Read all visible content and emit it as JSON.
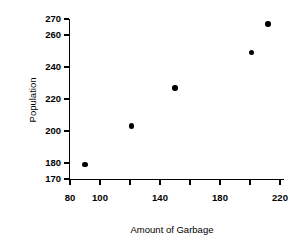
{
  "chart_data": {
    "type": "scatter",
    "title": "",
    "xlabel": "Amount of Garbage",
    "ylabel": "Population",
    "xlim": [
      80,
      222
    ],
    "ylim": [
      170,
      270
    ],
    "grid": false,
    "legend": null,
    "marker": {
      "shape": "circle",
      "color": "#000000",
      "size": 5.6
    },
    "x_ticks": [
      80,
      100,
      120,
      140,
      160,
      180,
      200,
      220
    ],
    "x_tick_labels": [
      "80",
      "100",
      "",
      "140",
      "",
      "180",
      "",
      "220"
    ],
    "y_ticks": [
      170,
      180,
      200,
      220,
      240,
      260,
      270
    ],
    "y_tick_labels": [
      "170",
      "180",
      "200",
      "220",
      "240",
      "260",
      "270"
    ],
    "points": [
      {
        "x": 90,
        "y": 179
      },
      {
        "x": 121,
        "y": 203
      },
      {
        "x": 150,
        "y": 227
      },
      {
        "x": 201,
        "y": 249
      },
      {
        "x": 212,
        "y": 267
      }
    ],
    "x": [
      90,
      121,
      150,
      201,
      212
    ],
    "values": [
      179,
      203,
      227,
      249,
      267
    ],
    "axis_color": "#000000",
    "background_color": "#ffffff"
  }
}
